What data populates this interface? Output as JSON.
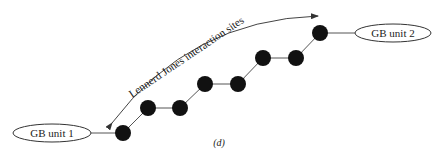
{
  "diagram": {
    "caption": "(d)",
    "arrow_label": "Lennerd Jones interaction sites",
    "units": [
      {
        "label": "GB unit 1"
      },
      {
        "label": "GB unit 2"
      }
    ],
    "sites_count": 8,
    "colors": {
      "node": "#111111",
      "line": "#555555",
      "ellipse_stroke": "#333333"
    }
  }
}
